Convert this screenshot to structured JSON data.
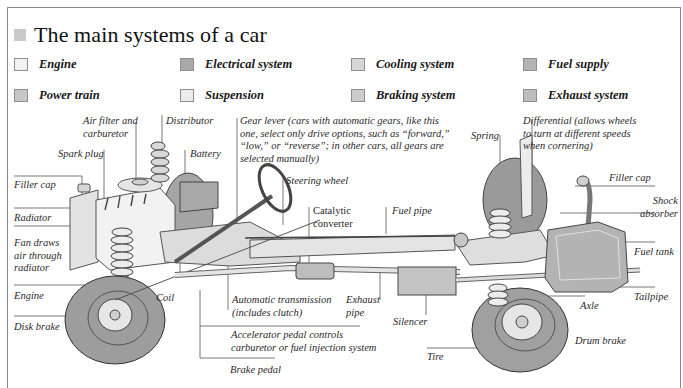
{
  "title": "The main systems of a car",
  "title_swatch_color": "#c9c9c9",
  "legend": [
    {
      "label": "Engine",
      "color": "#f2f2f2"
    },
    {
      "label": "Electrical system",
      "color": "#a9a9a9"
    },
    {
      "label": "Cooling system",
      "color": "#d6d6d6"
    },
    {
      "label": "Fuel supply",
      "color": "#b3b3b3"
    },
    {
      "label": "Power train",
      "color": "#c6c6c6"
    },
    {
      "label": "Suspension",
      "color": "#ececec"
    },
    {
      "label": "Braking system",
      "color": "#cdcdcd"
    },
    {
      "label": "Exhaust system",
      "color": "#bdbdbd"
    }
  ],
  "labels": {
    "air_filter": [
      "Air filter and",
      "carburetor"
    ],
    "distributor": "Distributor",
    "spark_plug": "Spark plug",
    "battery": "Battery",
    "gear_lever": [
      "Gear lever (cars with automatic gears, like this",
      "one, select only drive options, such as “forward,”",
      "“low,” or “reverse”; in other cars, all gears are",
      "selected manually)"
    ],
    "steering_wheel": "Steering wheel",
    "catalytic_converter": [
      "Catalytic",
      "converter"
    ],
    "fuel_pipe": "Fuel pipe",
    "spring": "Spring",
    "differential": [
      "Differential (allows wheels",
      "to turn at different speeds",
      "when cornering)"
    ],
    "filler_cap_left": "Filler cap",
    "filler_cap_right": "Filler cap",
    "radiator": "Radiator",
    "fan": [
      "Fan draws",
      "air through",
      "radiator"
    ],
    "engine": "Engine",
    "disk_brake": "Disk brake",
    "coil": "Coil",
    "automatic_transmission": [
      "Automatic transmission",
      "(includes clutch)"
    ],
    "exhaust_pipe": [
      "Exhaust",
      "pipe"
    ],
    "silencer": "Silencer",
    "accelerator": [
      "Accelerator pedal controls",
      "carburetor or fuel injection system"
    ],
    "brake_pedal": "Brake pedal",
    "tire": "Tire",
    "shock_absorber": [
      "Shock",
      "absorber"
    ],
    "fuel_tank": "Fuel tank",
    "tailpipe": "Tailpipe",
    "axle": "Axle",
    "drum_brake": "Drum brake"
  }
}
